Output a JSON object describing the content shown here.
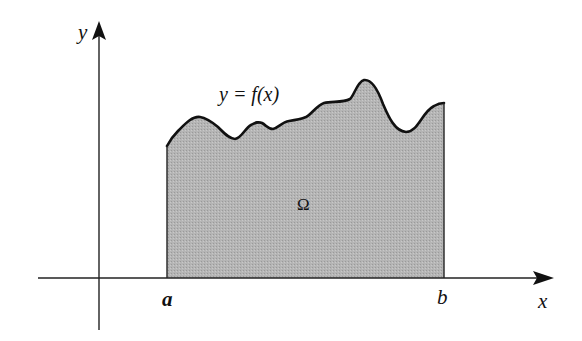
{
  "figure": {
    "axes": {
      "x_label": "x",
      "y_label": "y"
    },
    "curve_label": "y = f(x)",
    "region_label": "Ω",
    "bounds": {
      "a_label": "a",
      "b_label": "b"
    },
    "colors": {
      "fill": "#b3b3b3",
      "stroke": "#111111",
      "axis": "#222222",
      "background": "#ffffff"
    }
  }
}
